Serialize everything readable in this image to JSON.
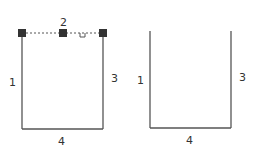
{
  "figures": [
    {
      "id": "left",
      "edges": [
        {
          "label": "1",
          "side": "left"
        },
        {
          "label": "2",
          "side": "top",
          "style": "dashed"
        },
        {
          "label": "3",
          "side": "right"
        },
        {
          "label": "4",
          "side": "bottom"
        }
      ],
      "handles": 3,
      "marker": "u"
    },
    {
      "id": "right",
      "edges": [
        {
          "label": "1",
          "side": "left"
        },
        {
          "label": "3",
          "side": "right"
        },
        {
          "label": "4",
          "side": "bottom"
        }
      ]
    }
  ],
  "colors": {
    "line": "#555555",
    "handle": "#333333",
    "text": "#333333"
  }
}
